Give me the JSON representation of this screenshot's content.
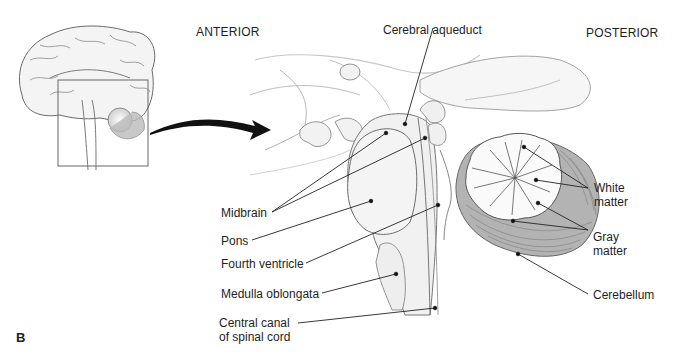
{
  "figure": {
    "panel_label": "B",
    "orientation": {
      "anterior": "ANTERIOR",
      "posterior": "POSTERIOR"
    },
    "inset": {
      "description": "sagittal whole-brain thumbnail with box around brainstem region",
      "arrow": "curved-arrow-right"
    },
    "labels": {
      "cerebral_aqueduct": "Cerebral aqueduct",
      "midbrain": "Midbrain",
      "pons": "Pons",
      "fourth_ventricle": "Fourth ventricle",
      "medulla_oblongata": "Medulla oblongata",
      "central_canal_line1": "Central canal",
      "central_canal_line2": "of spinal cord",
      "white_matter_line1": "White",
      "white_matter_line2": "matter",
      "gray_matter_line1": "Gray",
      "gray_matter_line2": "matter",
      "cerebellum": "Cerebellum"
    },
    "colors": {
      "line": "#222222",
      "outline": "#6a6a6a",
      "tissue_fill": "#f2f2f2",
      "gray_matter_fill": "#a8a8a8",
      "white_matter_fill": "#fafafa"
    }
  }
}
